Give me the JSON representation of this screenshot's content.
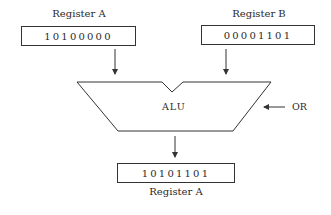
{
  "register_a": {
    "label": "Register A",
    "value": "10100000"
  },
  "register_b": {
    "label": "Register B",
    "value": "00001101"
  },
  "alu": {
    "label": "ALU"
  },
  "operation": {
    "label": "OR"
  },
  "result": {
    "label": "Register A",
    "value": "10101101"
  },
  "colors": {
    "line": "#333333",
    "background": "#ffffff"
  }
}
